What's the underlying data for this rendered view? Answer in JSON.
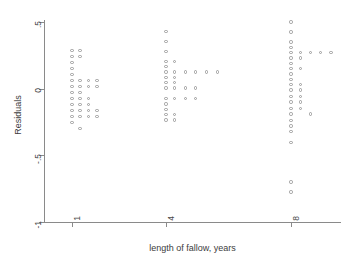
{
  "chart_data": {
    "type": "scatter",
    "title": "",
    "xlabel": "length of fallow, years",
    "ylabel": "Residuals",
    "xlim": [
      0.1,
      9.6
    ],
    "ylim": [
      -1,
      0.55
    ],
    "grid": false,
    "legend": null,
    "xticks": [
      1,
      4,
      8
    ],
    "xtick_labels": [
      "1",
      "4",
      "8"
    ],
    "yticks": [
      0.5,
      0,
      -0.5,
      -1
    ],
    "ytick_labels": [
      ".5",
      "0",
      "-.5",
      "-1"
    ],
    "marker": "open-circle",
    "marker_color": "#9b9b9b",
    "note": "Residual dot-density plot: points jittered horizontally in stacks at each fallow-length group.",
    "points": [
      {
        "x": 1.0,
        "y": 0.285
      },
      {
        "x": 1.0,
        "y": 0.24
      },
      {
        "x": 1.0,
        "y": 0.195
      },
      {
        "x": 1.0,
        "y": 0.15
      },
      {
        "x": 1.0,
        "y": 0.105
      },
      {
        "x": 1.0,
        "y": 0.06
      },
      {
        "x": 1.0,
        "y": 0.015
      },
      {
        "x": 1.0,
        "y": -0.03
      },
      {
        "x": 1.0,
        "y": -0.075
      },
      {
        "x": 1.0,
        "y": -0.12
      },
      {
        "x": 1.0,
        "y": -0.165
      },
      {
        "x": 1.0,
        "y": -0.21
      },
      {
        "x": 1.0,
        "y": -0.255
      },
      {
        "x": 1.25,
        "y": 0.285
      },
      {
        "x": 1.25,
        "y": 0.24
      },
      {
        "x": 1.25,
        "y": 0.06
      },
      {
        "x": 1.25,
        "y": 0.015
      },
      {
        "x": 1.25,
        "y": -0.03
      },
      {
        "x": 1.25,
        "y": -0.075
      },
      {
        "x": 1.25,
        "y": -0.12
      },
      {
        "x": 1.25,
        "y": -0.165
      },
      {
        "x": 1.25,
        "y": -0.21
      },
      {
        "x": 1.25,
        "y": -0.3
      },
      {
        "x": 1.52,
        "y": 0.06
      },
      {
        "x": 1.52,
        "y": 0.015
      },
      {
        "x": 1.52,
        "y": -0.075
      },
      {
        "x": 1.52,
        "y": -0.12
      },
      {
        "x": 1.52,
        "y": -0.165
      },
      {
        "x": 1.52,
        "y": -0.21
      },
      {
        "x": 1.8,
        "y": 0.06
      },
      {
        "x": 1.8,
        "y": 0.015
      },
      {
        "x": 1.8,
        "y": -0.165
      },
      {
        "x": 1.8,
        "y": -0.21
      },
      {
        "x": 4.0,
        "y": 0.43
      },
      {
        "x": 4.0,
        "y": 0.355
      },
      {
        "x": 4.0,
        "y": 0.28
      },
      {
        "x": 4.0,
        "y": 0.205
      },
      {
        "x": 4.0,
        "y": 0.165
      },
      {
        "x": 4.0,
        "y": 0.125
      },
      {
        "x": 4.0,
        "y": 0.085
      },
      {
        "x": 4.0,
        "y": 0.045
      },
      {
        "x": 4.0,
        "y": 0.005
      },
      {
        "x": 4.0,
        "y": -0.075
      },
      {
        "x": 4.0,
        "y": -0.115
      },
      {
        "x": 4.0,
        "y": -0.155
      },
      {
        "x": 4.0,
        "y": -0.195
      },
      {
        "x": 4.0,
        "y": -0.235
      },
      {
        "x": 4.28,
        "y": 0.205
      },
      {
        "x": 4.28,
        "y": 0.125
      },
      {
        "x": 4.28,
        "y": 0.085
      },
      {
        "x": 4.28,
        "y": 0.045
      },
      {
        "x": 4.28,
        "y": 0.005
      },
      {
        "x": 4.28,
        "y": -0.075
      },
      {
        "x": 4.28,
        "y": -0.195
      },
      {
        "x": 4.28,
        "y": -0.235
      },
      {
        "x": 4.62,
        "y": 0.125
      },
      {
        "x": 4.62,
        "y": 0.005
      },
      {
        "x": 4.62,
        "y": -0.075
      },
      {
        "x": 4.95,
        "y": 0.125
      },
      {
        "x": 4.95,
        "y": 0.005
      },
      {
        "x": 4.95,
        "y": -0.075
      },
      {
        "x": 5.3,
        "y": 0.125
      },
      {
        "x": 5.65,
        "y": 0.125
      },
      {
        "x": 8.0,
        "y": 0.5
      },
      {
        "x": 8.0,
        "y": 0.425
      },
      {
        "x": 8.0,
        "y": 0.35
      },
      {
        "x": 8.0,
        "y": 0.31
      },
      {
        "x": 8.0,
        "y": 0.27
      },
      {
        "x": 8.0,
        "y": 0.23
      },
      {
        "x": 8.0,
        "y": 0.19
      },
      {
        "x": 8.0,
        "y": 0.15
      },
      {
        "x": 8.0,
        "y": 0.11
      },
      {
        "x": 8.0,
        "y": 0.07
      },
      {
        "x": 8.0,
        "y": 0.03
      },
      {
        "x": 8.0,
        "y": -0.01
      },
      {
        "x": 8.0,
        "y": -0.06
      },
      {
        "x": 8.0,
        "y": -0.1
      },
      {
        "x": 8.0,
        "y": -0.15
      },
      {
        "x": 8.0,
        "y": -0.19
      },
      {
        "x": 8.0,
        "y": -0.24
      },
      {
        "x": 8.0,
        "y": -0.28
      },
      {
        "x": 8.0,
        "y": -0.32
      },
      {
        "x": 8.0,
        "y": -0.405
      },
      {
        "x": 8.0,
        "y": -0.7
      },
      {
        "x": 8.0,
        "y": -0.775
      },
      {
        "x": 8.3,
        "y": 0.27
      },
      {
        "x": 8.3,
        "y": 0.23
      },
      {
        "x": 8.3,
        "y": 0.15
      },
      {
        "x": 8.3,
        "y": 0.03
      },
      {
        "x": 8.3,
        "y": -0.01
      },
      {
        "x": 8.3,
        "y": -0.06
      },
      {
        "x": 8.3,
        "y": -0.1
      },
      {
        "x": 8.3,
        "y": -0.15
      },
      {
        "x": 8.62,
        "y": 0.27
      },
      {
        "x": 8.62,
        "y": -0.19
      },
      {
        "x": 8.95,
        "y": 0.27
      },
      {
        "x": 9.28,
        "y": 0.27
      }
    ]
  }
}
